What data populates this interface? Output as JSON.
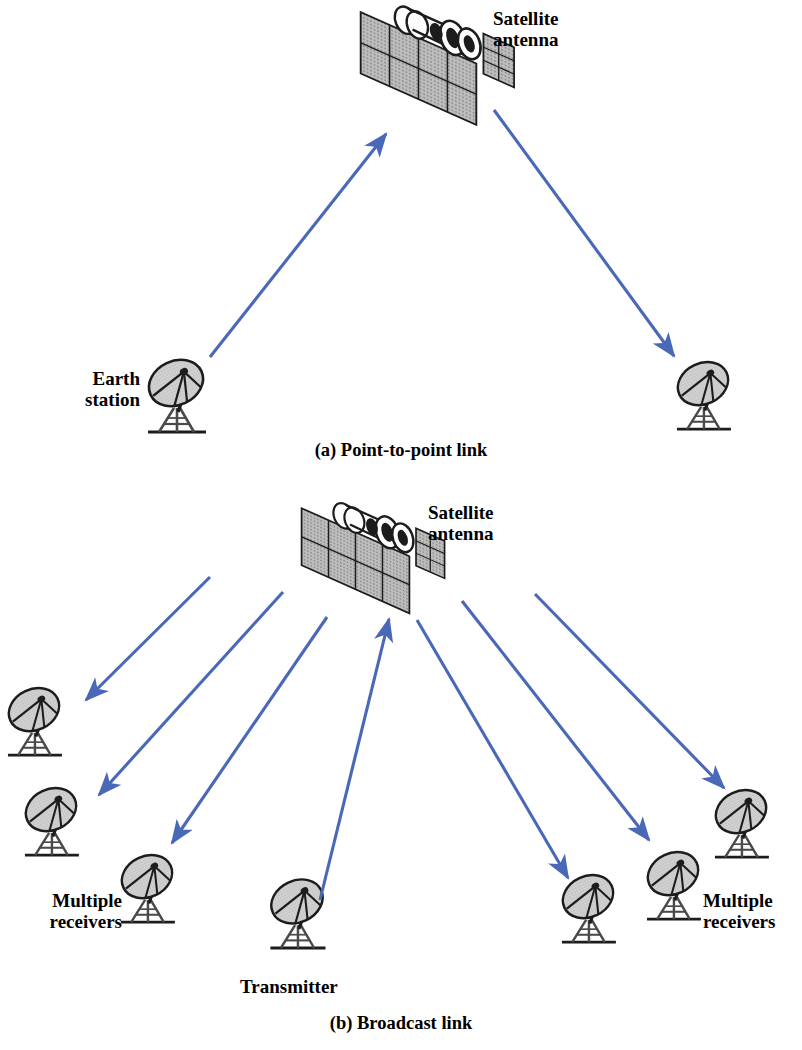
{
  "figure": {
    "background_color": "#ffffff",
    "arrow_color": "#4a68b8",
    "line_color": "#1a1a1a",
    "panel_fill": "#b0b0b0",
    "dish_fill": "#c9c9c9"
  },
  "panels": [
    {
      "id": "a",
      "caption": "(a) Point-to-point link",
      "labels": {
        "satellite": "Satellite\nantenna",
        "earth_station": "Earth\nstation"
      },
      "nodes": [
        {
          "name": "satellite-antenna-a",
          "x": 448,
          "y": 58
        },
        {
          "name": "earth-station-left",
          "x": 176,
          "y": 392
        },
        {
          "name": "earth-station-right",
          "x": 703,
          "y": 392
        }
      ],
      "arrows": [
        {
          "name": "uplink-arrow",
          "from": [
            210,
            357
          ],
          "to": [
            386,
            134
          ],
          "direction": "up-right"
        },
        {
          "name": "downlink-arrow",
          "from": [
            494,
            110
          ],
          "to": [
            674,
            356
          ],
          "direction": "down-right"
        }
      ]
    },
    {
      "id": "b",
      "caption": "(b) Broadcast link",
      "labels": {
        "satellite": "Satellite\nantenna",
        "receivers_left": "Multiple\nreceivers",
        "receivers_right": "Multiple\nreceivers",
        "transmitter": "Transmitter"
      },
      "nodes": [
        {
          "name": "satellite-antenna-b",
          "x": 383,
          "y": 551
        },
        {
          "name": "receiver-left-1",
          "x": 34,
          "y": 718
        },
        {
          "name": "receiver-left-2",
          "x": 51,
          "y": 818
        },
        {
          "name": "receiver-left-3",
          "x": 147,
          "y": 885
        },
        {
          "name": "transmitter-dish",
          "x": 297,
          "y": 910
        },
        {
          "name": "receiver-right-1",
          "x": 588,
          "y": 905
        },
        {
          "name": "receiver-right-2",
          "x": 673,
          "y": 882
        },
        {
          "name": "receiver-right-3",
          "x": 741,
          "y": 820
        }
      ],
      "arrows": [
        {
          "name": "broadcast-arrow-left-1",
          "from": [
            210,
            577
          ],
          "to": [
            86,
            700
          ],
          "direction": "down-left"
        },
        {
          "name": "broadcast-arrow-left-2",
          "from": [
            283,
            592
          ],
          "to": [
            99,
            795
          ],
          "direction": "down-left"
        },
        {
          "name": "broadcast-arrow-left-3",
          "from": [
            327,
            617
          ],
          "to": [
            172,
            843
          ],
          "direction": "down-left"
        },
        {
          "name": "uplink-arrow-b",
          "from": [
            320,
            900
          ],
          "to": [
            389,
            619
          ],
          "direction": "up"
        },
        {
          "name": "broadcast-arrow-right-1",
          "from": [
            417,
            620
          ],
          "to": [
            568,
            878
          ],
          "direction": "down-right"
        },
        {
          "name": "broadcast-arrow-right-2",
          "from": [
            462,
            601
          ],
          "to": [
            649,
            840
          ],
          "direction": "down-right"
        },
        {
          "name": "broadcast-arrow-right-3",
          "from": [
            535,
            594
          ],
          "to": [
            724,
            788
          ],
          "direction": "down-right"
        }
      ]
    }
  ]
}
